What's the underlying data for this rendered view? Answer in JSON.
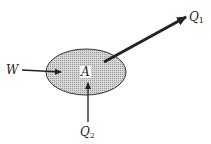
{
  "diagram": {
    "body": {
      "label": "A",
      "fill_color": "#c8c8c8",
      "stroke_color": "#333333"
    },
    "forces": [
      {
        "name": "W",
        "symbol": "W",
        "subscript": "",
        "direction": "right (into body)"
      },
      {
        "name": "Q1",
        "symbol": "Q",
        "subscript": "1",
        "direction": "up-right (away from body)"
      },
      {
        "name": "Q2",
        "symbol": "Q",
        "subscript": "2",
        "direction": "up (into body)"
      }
    ],
    "colors": {
      "line": "#222222",
      "background": "#ffffff"
    }
  }
}
